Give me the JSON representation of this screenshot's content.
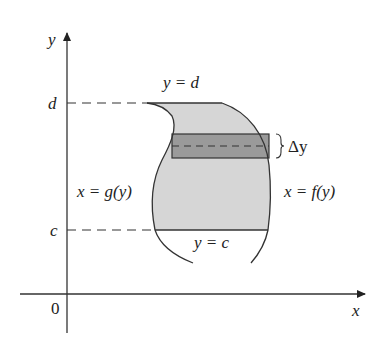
{
  "diagram": {
    "axes": {
      "x_label": "x",
      "y_label": "y",
      "origin_label": "0"
    },
    "levels": {
      "d_label": "d",
      "c_label": "c"
    },
    "boundary_labels": {
      "top": "y = d",
      "bottom": "y = c",
      "left": "x = g(y)",
      "right": "x = f(y)"
    },
    "strip": {
      "width_label": "Δy"
    },
    "colors": {
      "region_fill": "#d6d6d6",
      "strip_fill": "#9a9a9a",
      "line": "#333333"
    }
  }
}
